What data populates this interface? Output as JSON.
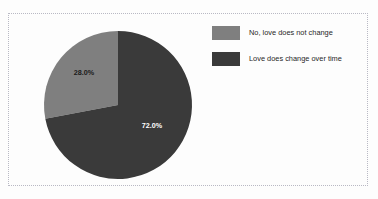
{
  "chart_data": {
    "type": "pie",
    "title": "Does love change over time?",
    "title_visible_fragment": "",
    "categories": [
      "No, love does not change",
      "Love does change over time"
    ],
    "values": [
      28.0,
      72.0
    ],
    "data_labels": [
      "28.0%",
      "72.0%"
    ],
    "colors": [
      "#7f7f7f",
      "#3a3a3a"
    ],
    "label_text_colors": [
      "#1a1a1a",
      "#ffffff"
    ],
    "start_angle_deg": 90,
    "direction": "counterclockwise",
    "legend": {
      "position": "right",
      "entries": [
        {
          "label": "No, love does not change",
          "color": "#7f7f7f",
          "value": 28.0
        },
        {
          "label": "Love does change over time",
          "color": "#3a3a3a",
          "value": 72.0
        }
      ]
    },
    "grid": false,
    "xlabel": "",
    "ylabel": "",
    "units": "percent"
  },
  "canvas": {
    "background": "#fdfdfd",
    "border_color": "#b9b9c4",
    "border_style": "dotted"
  },
  "geometry": {
    "center_x": 118,
    "center_y": 105,
    "radius": 74,
    "label_28_x": 84,
    "label_28_y": 73,
    "label_72_x": 152,
    "label_72_y": 126
  }
}
